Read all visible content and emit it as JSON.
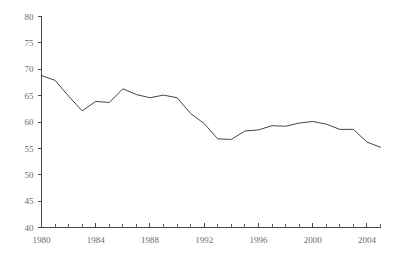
{
  "chart_data": {
    "type": "line",
    "title": "",
    "xlabel": "",
    "ylabel": "",
    "xlim": [
      1980,
      2005
    ],
    "ylim": [
      40,
      80
    ],
    "grid": false,
    "legend": null,
    "line_color": "#454545",
    "axis_color": "#4a4a4a",
    "label_color": "#6b6b6b",
    "background": "#ffffff",
    "x_tick_labels": [
      "1980",
      "1984",
      "1988",
      "1992",
      "1996",
      "2000",
      "2004"
    ],
    "x_tick_values": [
      1980,
      1984,
      1988,
      1992,
      1996,
      2000,
      2004
    ],
    "x_minor_step": 1,
    "y_tick_labels": [
      "40",
      "45",
      "50",
      "55",
      "60",
      "65",
      "70",
      "75",
      "80"
    ],
    "y_tick_values": [
      40,
      45,
      50,
      55,
      60,
      65,
      70,
      75,
      80
    ],
    "x": [
      1980,
      1981,
      1982,
      1983,
      1984,
      1985,
      1986,
      1987,
      1988,
      1989,
      1990,
      1991,
      1992,
      1993,
      1994,
      1995,
      1996,
      1997,
      1998,
      1999,
      2000,
      2001,
      2002,
      2003,
      2004,
      2005
    ],
    "values": [
      68.8,
      67.9,
      64.9,
      62.1,
      63.9,
      63.7,
      66.3,
      65.2,
      64.6,
      65.1,
      64.6,
      61.6,
      59.7,
      56.8,
      56.7,
      58.3,
      58.5,
      59.3,
      59.2,
      59.8,
      60.1,
      59.6,
      58.6,
      58.6,
      56.2,
      55.2
    ],
    "series": [
      {
        "name": "series-1",
        "values": [
          68.8,
          67.9,
          64.9,
          62.1,
          63.9,
          63.7,
          66.3,
          65.2,
          64.6,
          65.1,
          64.6,
          61.6,
          59.7,
          56.8,
          56.7,
          58.3,
          58.5,
          59.3,
          59.2,
          59.8,
          60.1,
          59.6,
          58.6,
          58.6,
          56.2,
          55.2
        ]
      }
    ]
  }
}
